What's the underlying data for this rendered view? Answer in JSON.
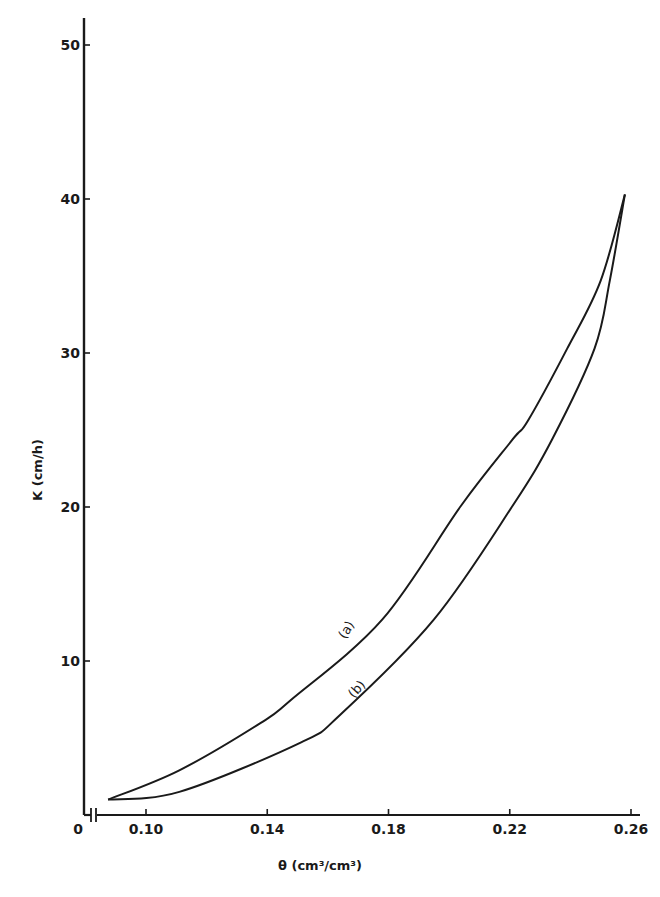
{
  "chart_data": {
    "type": "line",
    "title": "",
    "xlabel": "θ (cm³/cm³)",
    "ylabel": "K (cm/h)",
    "xlim": [
      0.085,
      0.26
    ],
    "ylim": [
      0,
      52
    ],
    "x_axis_break": true,
    "x_origin_label": "0",
    "grid": false,
    "legend": "none (curves labelled inline)",
    "x_ticks": [
      0.1,
      0.14,
      0.18,
      0.22,
      0.26
    ],
    "x_tick_labels": [
      "0.10",
      "0.14",
      "0.18",
      "0.22",
      "0.26"
    ],
    "y_ticks": [
      10,
      20,
      30,
      40,
      50
    ],
    "y_tick_labels": [
      "10",
      "20",
      "30",
      "40",
      "50"
    ],
    "series": [
      {
        "name": "(a)",
        "x": [
          0.0875,
          0.111,
          0.138,
          0.148,
          0.178,
          0.204,
          0.221,
          0.226,
          0.239,
          0.25,
          0.258
        ],
        "y": [
          1.0,
          2.9,
          6.0,
          7.5,
          12.7,
          20.1,
          24.4,
          25.6,
          30.3,
          34.7,
          40.3
        ]
      },
      {
        "name": "(b)",
        "x": [
          0.0875,
          0.111,
          0.151,
          0.164,
          0.195,
          0.221,
          0.234,
          0.248,
          0.253,
          0.258
        ],
        "y": [
          1.0,
          1.5,
          4.7,
          6.5,
          12.7,
          20.1,
          24.4,
          30.3,
          34.7,
          40.3
        ]
      }
    ],
    "annotations": [
      {
        "text": "(a)",
        "near_x": 0.171,
        "near_y": 12.5
      },
      {
        "text": "(b)",
        "near_x": 0.173,
        "near_y": 8.5
      }
    ]
  },
  "labels": {
    "x_axis_title": "θ (cm³/cm³)",
    "y_axis_title": "K (cm/h)",
    "origin": "0",
    "curve_a": "(a)",
    "curve_b": "(b)"
  },
  "colors": {
    "ink": "#1a1a1a",
    "background": "#ffffff"
  }
}
